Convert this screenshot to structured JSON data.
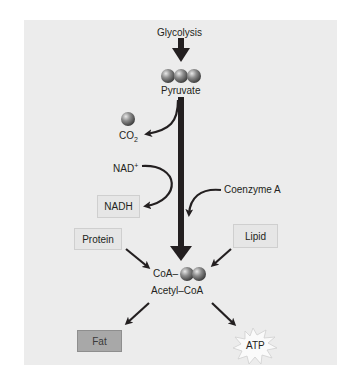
{
  "diagram": {
    "nodes": {
      "glycolysis": "Glycolysis",
      "pyruvate": "Pyruvate",
      "co2_main": "CO",
      "co2_sub": "2",
      "nad_main": "NAD",
      "nad_sup": "+",
      "nadh": "NADH",
      "coenzyme_a": "Coenzyme A",
      "protein": "Protein",
      "lipid": "Lipid",
      "coa_prefix": "CoA–",
      "acetyl_coa": "Acetyl–CoA",
      "fat": "Fat",
      "atp": "ATP"
    },
    "edges": [
      {
        "from": "Glycolysis",
        "to": "Pyruvate"
      },
      {
        "from": "Pyruvate",
        "to": "CO2"
      },
      {
        "from": "NAD+",
        "to": "NADH"
      },
      {
        "from": "Coenzyme A",
        "to": "Acetyl-CoA"
      },
      {
        "from": "Pyruvate",
        "to": "Acetyl-CoA"
      },
      {
        "from": "Protein",
        "to": "Acetyl-CoA"
      },
      {
        "from": "Lipid",
        "to": "Acetyl-CoA"
      },
      {
        "from": "Acetyl-CoA",
        "to": "Fat"
      },
      {
        "from": "Acetyl-CoA",
        "to": "ATP"
      }
    ],
    "colors": {
      "panel_bg": "#ececec",
      "arrow": "#231f20",
      "sphere": "#7a7a7a",
      "fat_box": "#a8a8a8",
      "light_box": "#e6e6e6"
    }
  }
}
